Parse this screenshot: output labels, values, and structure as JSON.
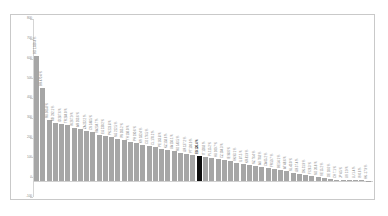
{
  "chart_data": {
    "type": "bar",
    "title": "",
    "subtitle": "",
    "xlabel": "",
    "ylabel": "",
    "ylim": [
      -100,
      800
    ],
    "grid": false,
    "legend": "none",
    "orientation": "vertical",
    "sorted": "descending",
    "highlight_index": 26,
    "highlight_color": "#0d0d0d",
    "bar_color": "#a6a6a6",
    "ytick_labels": [
      "800",
      "700",
      "600",
      "500",
      "400",
      "300",
      "200",
      "100",
      "0",
      "-100"
    ],
    "ytick_values": [
      800,
      700,
      600,
      500,
      400,
      300,
      200,
      100,
      0,
      -100
    ],
    "categories": [
      "BD 1,030.4 %",
      "BR 470.4 %",
      "RU 305.8 %",
      "MX 292.1 %",
      "ID 287.6 %",
      "TR 284.0 %",
      "IN 267.9 %",
      "AR 263.6 %",
      "ZA 252.2 %",
      "CN 248.5 %",
      "SA 234.7 %",
      "EG 230.2 %",
      "PK 223.8 %",
      "NG 212.5 %",
      "VN 205.2 %",
      "TH 198.0 %",
      "PH 190.6 %",
      "MY 182.4 %",
      "CO 176.5 %",
      "CL 170.2 %",
      "PE 163.8 %",
      "KZ 158.6 %",
      "UA 150.1 %",
      "RO 143.5 %",
      "GR 137.2 %",
      "PT 130.9 %",
      "ES 126.4 %",
      "IT 120.8 %",
      "PL 115.2 %",
      "HU 109.7 %",
      "CZ 104.3 %",
      "IE 98.6 %",
      "SK 93.1 %",
      "IL 87.5 %",
      "KR 81.9 %",
      "NZ 76.4 %",
      "AU 70.8 %",
      "CA 65.2 %",
      "FR 59.7 %",
      "BE 54.1 %",
      "AT 48.6 %",
      "NL 43.0 %",
      "GB 37.4 %",
      "DK 31.9 %",
      "FI 26.3 %",
      "NO 20.8 %",
      "SE 15.2 %",
      "DE 10.6 %",
      "CH 7.1 %",
      "JP 4.5 %",
      "US 2.9 %",
      "LU 1.4 %",
      "IS 0.6 %",
      "HK -17.9 %"
    ],
    "values": [
      630,
      470,
      306,
      292,
      288,
      284,
      268,
      264,
      252,
      249,
      235,
      230,
      224,
      213,
      205,
      198,
      191,
      182,
      177,
      170,
      164,
      159,
      150,
      144,
      137,
      131,
      126,
      121,
      115,
      110,
      104,
      99,
      93,
      88,
      82,
      76,
      71,
      65,
      60,
      54,
      49,
      43,
      37,
      32,
      26,
      21,
      15,
      11,
      7,
      5,
      3,
      2,
      1,
      -4
    ]
  }
}
